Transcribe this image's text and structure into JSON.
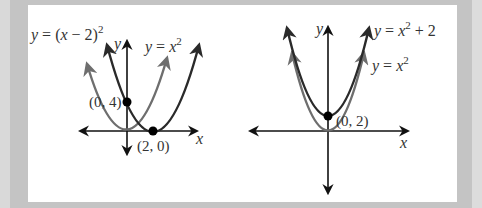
{
  "colors": {
    "dark_curve": "#2a2a2a",
    "light_curve": "#6e6e6e",
    "axis": "#111111",
    "panel": "#ffffff",
    "frame": "#c4c4c4"
  },
  "left_graph": {
    "curves": [
      {
        "name": "y = (x - 2)^2",
        "label_text": "y = (x − 2)",
        "label_exp": "2",
        "style": "dark"
      },
      {
        "name": "y = x^2",
        "label_text": "y = x",
        "label_exp": "2",
        "style": "light"
      }
    ],
    "axis_labels": {
      "x": "x",
      "y": "y"
    },
    "points": [
      {
        "label": "(0, 4)",
        "x": 0,
        "y": 4
      },
      {
        "label": "(2, 0)",
        "x": 2,
        "y": 0
      }
    ]
  },
  "right_graph": {
    "curves": [
      {
        "name": "y = x^2 + 2",
        "label_text": "y = x",
        "label_exp": "2",
        "label_tail": " + 2",
        "style": "dark"
      },
      {
        "name": "y = x^2",
        "label_text": "y = x",
        "label_exp": "2",
        "style": "light"
      }
    ],
    "axis_labels": {
      "x": "x",
      "y": "y"
    },
    "points": [
      {
        "label": "(0, 2)",
        "x": 0,
        "y": 2
      }
    ]
  }
}
